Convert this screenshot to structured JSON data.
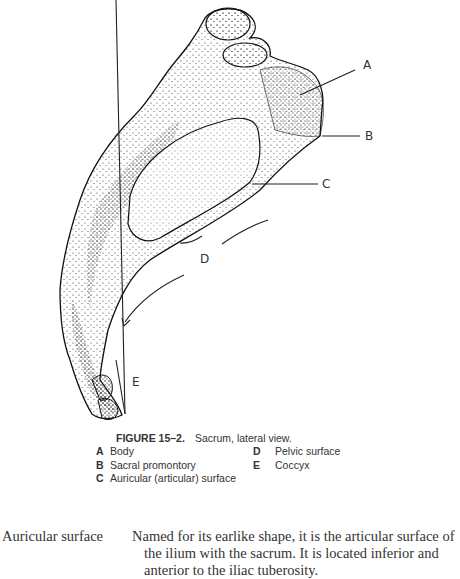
{
  "figure": {
    "labels": {
      "a": "A",
      "b": "B",
      "c": "C",
      "d": "D",
      "e": "E"
    },
    "caption": {
      "number": "FIGURE 15–2.",
      "title": "Sacrum, lateral view."
    },
    "legend": [
      {
        "key": "A",
        "label": "Body"
      },
      {
        "key": "B",
        "label": "Sacral promontory"
      },
      {
        "key": "C",
        "label": "Auricular (articular) surface"
      },
      {
        "key": "D",
        "label": "Pelvic surface"
      },
      {
        "key": "E",
        "label": "Coccyx"
      }
    ]
  },
  "glossary": {
    "term": "Auricular surface",
    "definition": "Named for its earlike shape, it is the articular surface of the ilium with the sacrum. It is located inferior and anterior to the iliac tuberosity."
  }
}
